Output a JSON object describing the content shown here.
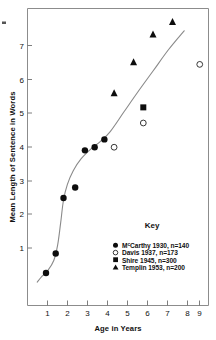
{
  "chart_data": {
    "type": "scatter",
    "title": "",
    "xlabel": "Age in Years",
    "ylabel": "Mean Length of Sentence in Words",
    "xlim": [
      0.55,
      9.85
    ],
    "ylim": [
      0.35,
      7.95
    ],
    "xticks": [
      1,
      2,
      3,
      4,
      5,
      6,
      7,
      8,
      9
    ],
    "yticks": [
      1,
      2,
      3,
      4,
      5,
      6,
      7
    ],
    "grid": false,
    "legend_position": "inside-lower-right",
    "legend_title": "Key",
    "series": [
      {
        "name": "McCarthy 1930, n=140",
        "marker": "filled-circle",
        "n": 140,
        "author": "McCarthy",
        "year": 1930,
        "points": [
          {
            "x": 1.5,
            "y": 1.18
          },
          {
            "x": 2.0,
            "y": 1.68
          },
          {
            "x": 2.4,
            "y": 3.1
          },
          {
            "x": 3.0,
            "y": 3.37
          },
          {
            "x": 3.5,
            "y": 4.32
          },
          {
            "x": 4.0,
            "y": 4.4
          },
          {
            "x": 4.5,
            "y": 4.6
          }
        ]
      },
      {
        "name": "Davis 1937, n=173",
        "marker": "open-circle",
        "n": 173,
        "author": "Davis",
        "year": 1937,
        "points": [
          {
            "x": 5.0,
            "y": 4.4
          },
          {
            "x": 6.5,
            "y": 5.02
          },
          {
            "x": 9.4,
            "y": 6.52
          }
        ]
      },
      {
        "name": "Shire 1945, n=300",
        "marker": "filled-square",
        "n": 300,
        "author": "Shire",
        "year": 1945,
        "points": [
          {
            "x": 6.5,
            "y": 5.42
          }
        ]
      },
      {
        "name": "Templin 1953, n=200",
        "marker": "filled-triangle",
        "n": 200,
        "author": "Templin",
        "year": 1953,
        "points": [
          {
            "x": 5.0,
            "y": 5.78
          },
          {
            "x": 6.0,
            "y": 6.57
          },
          {
            "x": 7.0,
            "y": 7.28
          },
          {
            "x": 8.0,
            "y": 7.6
          }
        ]
      }
    ],
    "trend_curve": {
      "name": "fitted-growth-curve",
      "points": [
        {
          "x": 1.05,
          "y": 0.95
        },
        {
          "x": 1.3,
          "y": 1.1
        },
        {
          "x": 1.6,
          "y": 1.25
        },
        {
          "x": 1.9,
          "y": 1.5
        },
        {
          "x": 2.1,
          "y": 1.9
        },
        {
          "x": 2.25,
          "y": 2.45
        },
        {
          "x": 2.4,
          "y": 3.05
        },
        {
          "x": 2.6,
          "y": 3.45
        },
        {
          "x": 2.9,
          "y": 3.8
        },
        {
          "x": 3.3,
          "y": 4.1
        },
        {
          "x": 3.8,
          "y": 4.35
        },
        {
          "x": 4.3,
          "y": 4.55
        },
        {
          "x": 4.8,
          "y": 4.8
        },
        {
          "x": 5.5,
          "y": 5.3
        },
        {
          "x": 6.2,
          "y": 5.8
        },
        {
          "x": 7.0,
          "y": 6.35
        },
        {
          "x": 7.8,
          "y": 6.9
        },
        {
          "x": 8.6,
          "y": 7.38
        }
      ]
    }
  },
  "legend": {
    "title": "Key",
    "entries": [
      {
        "marker": "filled-circle",
        "prefix": "M",
        "sup": "c",
        "text": "Carthy 1930, n=140"
      },
      {
        "marker": "open-circle",
        "prefix": "Davis 1937, n=173",
        "sup": "",
        "text": ""
      },
      {
        "marker": "filled-square",
        "prefix": "Shire 1945, n=300",
        "sup": "",
        "text": ""
      },
      {
        "marker": "filled-triangle",
        "prefix": "Templin 1953, n=200",
        "sup": "",
        "text": ""
      }
    ]
  },
  "axes": {
    "x_title": "Age in Years",
    "y_title": "Mean Length of Sentence in Words",
    "x_tick_labels": [
      "1",
      "2",
      "3",
      "4",
      "5",
      "6",
      "7",
      "8",
      "9"
    ],
    "y_tick_labels": [
      "1",
      "2",
      "3",
      "4",
      "5",
      "6",
      "7"
    ]
  }
}
